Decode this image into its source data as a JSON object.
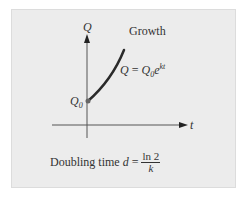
{
  "diagram": {
    "title": "Growth",
    "axes": {
      "y_label": "Q",
      "x_label": "t"
    },
    "initial_point_label": "Q",
    "initial_point_subscript": "0",
    "equation": {
      "lhs": "Q",
      "eq": " = ",
      "base": "Q",
      "base_sub": "0",
      "exp_base": "e",
      "exp": "kt"
    },
    "doubling": {
      "prefix": "Doubling time ",
      "var": "d",
      "eq": " = ",
      "numerator": "ln 2",
      "denominator": "k"
    },
    "colors": {
      "panel": "#ececec",
      "curve": "#2a2a2a",
      "axis": "#555555",
      "dot": "#666666"
    }
  }
}
